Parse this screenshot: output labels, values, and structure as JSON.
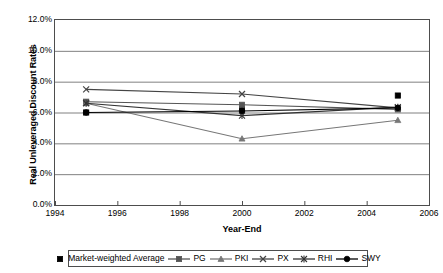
{
  "chart_data": {
    "type": "line",
    "title": "",
    "xlabel": "Year-End",
    "ylabel": "Real Unleveraged Discount Rates",
    "x": [
      1995,
      2000,
      2005
    ],
    "xlim": [
      1994,
      2006
    ],
    "ylim": [
      0,
      12
    ],
    "y_unit": "%",
    "grid": "horizontal",
    "legend_position": "bottom",
    "x_ticks": [
      "1994",
      "1996",
      "1998",
      "2000",
      "2002",
      "2004",
      "2006"
    ],
    "x_tick_values": [
      1994,
      1996,
      1998,
      2000,
      2002,
      2004,
      2006
    ],
    "y_ticks": [
      "0.0%",
      "2.0%",
      "4.0%",
      "6.0%",
      "8.0%",
      "10.0%",
      "12.0%"
    ],
    "y_tick_values": [
      0,
      2,
      4,
      6,
      8,
      10,
      12
    ],
    "series": [
      {
        "name": "Market-weighted Average",
        "marker": "square",
        "line": false,
        "color": "#000000",
        "values": [
          6.0,
          6.2,
          7.1
        ]
      },
      {
        "name": "PG",
        "marker": "square",
        "line": true,
        "color": "#555555",
        "values": [
          6.7,
          6.5,
          6.2
        ]
      },
      {
        "name": "PKI",
        "marker": "triangle",
        "line": true,
        "color": "#777777",
        "values": [
          6.6,
          4.3,
          5.5
        ]
      },
      {
        "name": "PX",
        "marker": "x",
        "line": true,
        "color": "#444444",
        "values": [
          7.5,
          7.2,
          6.3
        ]
      },
      {
        "name": "RHI",
        "marker": "asterisk",
        "line": true,
        "color": "#333333",
        "values": [
          6.6,
          5.8,
          6.35
        ]
      },
      {
        "name": "SWY",
        "marker": "circle",
        "line": true,
        "color": "#000000",
        "values": [
          6.0,
          6.1,
          6.3
        ]
      }
    ]
  },
  "axes": {
    "y_title": "Real Unleveraged Discount Rates",
    "x_title": "Year-End"
  },
  "legend": {
    "items": [
      {
        "label": "Market-weighted Average",
        "marker": "square",
        "line": false
      },
      {
        "label": "PG",
        "marker": "square",
        "line": true
      },
      {
        "label": "PKI",
        "marker": "triangle",
        "line": true
      },
      {
        "label": "PX",
        "marker": "x",
        "line": true
      },
      {
        "label": "RHI",
        "marker": "asterisk",
        "line": true
      },
      {
        "label": "SWY",
        "marker": "circle",
        "line": true
      }
    ]
  },
  "colors": {
    "axis": "#4d4d4d",
    "grid": "#808080",
    "plot_background": "#ffffff",
    "page_background": "#ffffff"
  }
}
